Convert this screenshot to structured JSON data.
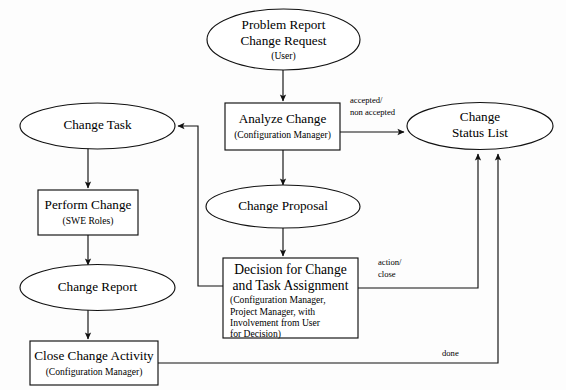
{
  "diagram": {
    "canvas": {
      "width": 566,
      "height": 390
    },
    "colors": {
      "stroke": "#111111",
      "fill": "#ffffff",
      "background": "#fdfdfd",
      "text": "#000000"
    },
    "nodes": {
      "problem_report": {
        "shape": "ellipse",
        "line1": "Problem Report",
        "line2": "Change Request",
        "sub1": "(User)"
      },
      "analyze_change": {
        "shape": "rectangle",
        "line1": "Analyze Change",
        "sub1": "(Configuration Manager)"
      },
      "change_status_list": {
        "shape": "ellipse",
        "line1": "Change",
        "line2": "Status List"
      },
      "change_task": {
        "shape": "ellipse",
        "line1": "Change Task"
      },
      "perform_change": {
        "shape": "rectangle",
        "line1": "Perform Change",
        "sub1": "(SWE Roles)"
      },
      "change_report": {
        "shape": "ellipse",
        "line1": "Change Report"
      },
      "close_change_activity": {
        "shape": "rectangle",
        "line1": "Close Change Activity",
        "sub1": "(Configuration Manager)"
      },
      "change_proposal": {
        "shape": "ellipse",
        "line1": "Change Proposal"
      },
      "decision_for_change": {
        "shape": "rectangle",
        "line1": "Decision for Change",
        "line2": "and Task Assignment",
        "sub1": "(Configuration Manager,",
        "sub2": "Project Manager, with",
        "sub3": "Involvement from User",
        "sub4": "for Decision)"
      }
    },
    "edge_labels": {
      "accepted_line1": "accepted/",
      "accepted_line2": "non accepted",
      "action_line1": "action/",
      "action_line2": "close",
      "done": "done"
    }
  }
}
